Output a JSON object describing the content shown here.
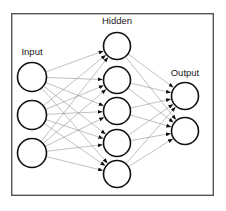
{
  "diagram": {
    "background_color": "#ffffff",
    "frame": {
      "x": 11,
      "y": 13,
      "width": 203,
      "height": 183,
      "stroke_color": "#555555"
    },
    "node": {
      "fill_color": "#ffffff",
      "stroke_color": "#111111"
    },
    "connection": {
      "line_color": "#8c8c8c",
      "arrow_color": "#111111"
    },
    "labels": {
      "input": "Input",
      "hidden": "Hidden",
      "output": "Output"
    },
    "layers": [
      {
        "name": "input",
        "label": "Input",
        "label_x": 32,
        "label_y": 55,
        "node_count": 3,
        "radius": 14.5,
        "cx": 32,
        "cy": [
          77,
          115,
          153
        ]
      },
      {
        "name": "hidden",
        "label": "Hidden",
        "label_x": 117,
        "label_y": 24,
        "node_count": 5,
        "radius": 13.5,
        "cx": 117,
        "cy": [
          46,
          80,
          111,
          143,
          174
        ]
      },
      {
        "name": "output",
        "label": "Output",
        "label_x": 185,
        "label_y": 76,
        "node_count": 2,
        "radius": 13.5,
        "cx": 185,
        "cy": [
          96,
          131
        ]
      }
    ],
    "connection_counts": {
      "input_to_hidden": 15,
      "hidden_to_output": 10,
      "total": 25
    }
  }
}
